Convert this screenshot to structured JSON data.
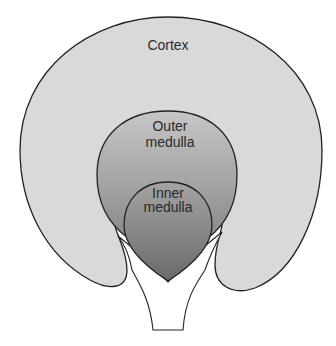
{
  "diagram": {
    "labels": {
      "cortex": "Cortex",
      "outer_medulla_line1": "Outer",
      "outer_medulla_line2": "medulla",
      "inner_medulla_line1": "Inner",
      "inner_medulla_line2": "medulla"
    },
    "colors": {
      "cortex_fill": "#d9d9d9",
      "outer_medulla_top": "#c4c4c4",
      "outer_medulla_bottom": "#8e8e8e",
      "inner_medulla_top": "#a2a2a2",
      "inner_medulla_bottom": "#6e6e6e",
      "pelvis_fill": "#ffffff",
      "outline": "#222222"
    }
  }
}
